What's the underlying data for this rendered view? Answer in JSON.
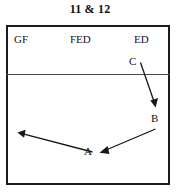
{
  "figure": {
    "title": "11 & 12",
    "type": "schematic-diagram",
    "frame": {
      "border_color": "#1c1c1c",
      "background": "#ffffff",
      "divider_color": "#4a4a4a"
    }
  },
  "region_labels": [
    {
      "id": "gf",
      "text": "GF"
    },
    {
      "id": "fed",
      "text": "FED"
    },
    {
      "id": "ed",
      "text": "ED"
    }
  ],
  "point_labels": [
    {
      "id": "c",
      "text": "C"
    },
    {
      "id": "b",
      "text": "B"
    },
    {
      "id": "a",
      "text": "A"
    }
  ],
  "arrows": [
    {
      "id": "c-to-b",
      "from": "C",
      "to": "B",
      "direction": "down-right"
    },
    {
      "id": "b-to-a",
      "from": "B",
      "to": "A",
      "direction": "down-left"
    },
    {
      "id": "a-to-left",
      "from": "A",
      "to": "left-edge",
      "direction": "up-left"
    }
  ]
}
